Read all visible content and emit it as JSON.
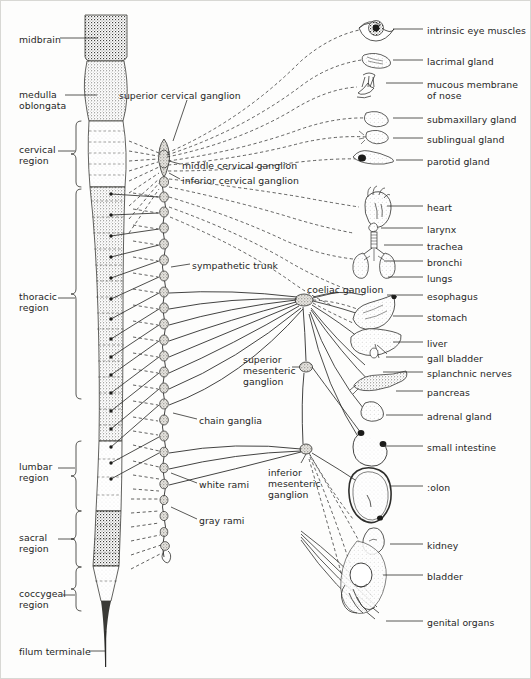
{
  "figure": {
    "background_color": "#fdfdfc",
    "ink_color": "#262626"
  },
  "left_labels": [
    {
      "id": "midbrain",
      "text": "midbrain",
      "x": 18,
      "y": 33
    },
    {
      "id": "medulla-oblongata",
      "text": "medulla\noblongata",
      "x": 18,
      "y": 88
    },
    {
      "id": "cervical-region",
      "text": "cervical\nregion",
      "x": 18,
      "y": 143
    },
    {
      "id": "thoracic-region",
      "text": "thoracic\nregion",
      "x": 18,
      "y": 290
    },
    {
      "id": "lumbar-region",
      "text": "lumbar\nregion",
      "x": 18,
      "y": 460
    },
    {
      "id": "sacral-region",
      "text": "sacral\nregion",
      "x": 18,
      "y": 531
    },
    {
      "id": "coccygeal-region",
      "text": "coccygeal\nregion",
      "x": 18,
      "y": 587
    },
    {
      "id": "filum-terminale",
      "text": "filum terminale",
      "x": 18,
      "y": 645
    }
  ],
  "center_labels": [
    {
      "id": "superior-cervical-ganglion",
      "text": "superior cervical ganglion",
      "x": 118,
      "y": 89
    },
    {
      "id": "middle-cervical-ganglion",
      "text": "middle cervical ganglion",
      "x": 181,
      "y": 159
    },
    {
      "id": "inferior-cervical-ganglion",
      "text": "inferior cervical ganglion",
      "x": 181,
      "y": 174
    },
    {
      "id": "sympathetic-trunk",
      "text": "sympathetic trunk",
      "x": 191,
      "y": 259
    },
    {
      "id": "coeliac-ganglion",
      "text": "coeliac ganglion",
      "x": 306,
      "y": 283
    },
    {
      "id": "superior-mesenteric-ganglion",
      "text": "superior\nmesenteric\nganglion",
      "x": 242,
      "y": 353
    },
    {
      "id": "chain-ganglia",
      "text": "chain ganglia",
      "x": 198,
      "y": 414
    },
    {
      "id": "white-rami",
      "text": "white rami",
      "x": 198,
      "y": 478
    },
    {
      "id": "inferior-mesenteric-ganglion",
      "text": "inferior\nmesenteric\nganglion",
      "x": 267,
      "y": 466
    },
    {
      "id": "gray-rami",
      "text": "gray rami",
      "x": 198,
      "y": 514
    }
  ],
  "right_labels": [
    {
      "id": "intrinsic-eye-muscles",
      "text": "intrinsic eye muscles",
      "x": 426,
      "y": 24,
      "leader_from": 392,
      "leader_to": 422,
      "leader_y": 28
    },
    {
      "id": "lacrimal-gland",
      "text": "lacrimal gland",
      "x": 426,
      "y": 55,
      "leader_from": 392,
      "leader_to": 422,
      "leader_y": 59
    },
    {
      "id": "mucous-membrane-of-nose",
      "text": "mucous membrane\nof nose",
      "x": 426,
      "y": 78,
      "leader_from": 385,
      "leader_to": 422,
      "leader_y": 82
    },
    {
      "id": "submaxillary-gland",
      "text": "submaxillary gland",
      "x": 426,
      "y": 113,
      "leader_from": 392,
      "leader_to": 422,
      "leader_y": 117
    },
    {
      "id": "sublingual-gland",
      "text": "sublingual gland",
      "x": 426,
      "y": 133,
      "leader_from": 392,
      "leader_to": 422,
      "leader_y": 137
    },
    {
      "id": "parotid-gland",
      "text": "parotid gland",
      "x": 426,
      "y": 155,
      "leader_from": 395,
      "leader_to": 422,
      "leader_y": 159
    },
    {
      "id": "heart",
      "text": "heart",
      "x": 426,
      "y": 201,
      "leader_from": 386,
      "leader_to": 422,
      "leader_y": 205
    },
    {
      "id": "larynx",
      "text": "larynx",
      "x": 426,
      "y": 223,
      "leader_from": 380,
      "leader_to": 422,
      "leader_y": 227
    },
    {
      "id": "trachea",
      "text": "trachea",
      "x": 426,
      "y": 240,
      "leader_from": 383,
      "leader_to": 422,
      "leader_y": 244
    },
    {
      "id": "bronchi",
      "text": "bronchi",
      "x": 426,
      "y": 256,
      "leader_from": 383,
      "leader_to": 422,
      "leader_y": 260
    },
    {
      "id": "lungs",
      "text": "lungs",
      "x": 426,
      "y": 272,
      "leader_from": 387,
      "leader_to": 422,
      "leader_y": 276
    },
    {
      "id": "esophagus",
      "text": "esophagus",
      "x": 426,
      "y": 290,
      "leader_from": 386,
      "leader_to": 422,
      "leader_y": 294
    },
    {
      "id": "stomach",
      "text": "stomach",
      "x": 426,
      "y": 311,
      "leader_from": 392,
      "leader_to": 422,
      "leader_y": 315
    },
    {
      "id": "liver",
      "text": "liver",
      "x": 426,
      "y": 337,
      "leader_from": 392,
      "leader_to": 422,
      "leader_y": 341
    },
    {
      "id": "gall-bladder",
      "text": "gall bladder",
      "x": 426,
      "y": 352,
      "leader_from": 385,
      "leader_to": 422,
      "leader_y": 356
    },
    {
      "id": "splanchnic-nerves",
      "text": "splanchnic nerves",
      "x": 426,
      "y": 367,
      "leader_from": 382,
      "leader_to": 422,
      "leader_y": 371
    },
    {
      "id": "pancreas",
      "text": "pancreas",
      "x": 426,
      "y": 386,
      "leader_from": 395,
      "leader_to": 422,
      "leader_y": 390
    },
    {
      "id": "adrenal-gland",
      "text": "adrenal gland",
      "x": 426,
      "y": 410,
      "leader_from": 385,
      "leader_to": 422,
      "leader_y": 414
    },
    {
      "id": "small-intestine",
      "text": "small intestine",
      "x": 426,
      "y": 441,
      "leader_from": 380,
      "leader_to": 422,
      "leader_y": 445
    },
    {
      "id": "colon",
      "text": ":olon",
      "x": 426,
      "y": 481,
      "leader_from": 390,
      "leader_to": 422,
      "leader_y": 485
    },
    {
      "id": "kidney",
      "text": "kidney",
      "x": 426,
      "y": 539,
      "leader_from": 389,
      "leader_to": 422,
      "leader_y": 543
    },
    {
      "id": "bladder",
      "text": "bladder",
      "x": 426,
      "y": 570,
      "leader_from": 382,
      "leader_to": 422,
      "leader_y": 574
    },
    {
      "id": "genital-organs",
      "text": "genital organs",
      "x": 426,
      "y": 616,
      "leader_from": 385,
      "leader_to": 422,
      "leader_y": 620
    }
  ],
  "spinal_cord": {
    "segments": [
      {
        "name": "midbrain",
        "y0": 14,
        "y1": 58,
        "shade": "#c9c6c0"
      },
      {
        "name": "medulla-oblongata",
        "y0": 58,
        "y1": 118,
        "shade": "#ddd9d3"
      },
      {
        "name": "cervical",
        "y0": 118,
        "y1": 186,
        "shade": "#f2f0ec"
      },
      {
        "name": "thoracic",
        "y0": 186,
        "y1": 440,
        "shade": "#d9d5cd"
      },
      {
        "name": "lumbar",
        "y0": 440,
        "y1": 510,
        "shade": "#eceae4"
      },
      {
        "name": "sacral",
        "y0": 510,
        "y1": 565,
        "shade": "#9a9890"
      },
      {
        "name": "coccygeal",
        "y0": 565,
        "y1": 600,
        "shade": "#e8e5df"
      },
      {
        "name": "filum-terminale",
        "y0": 600,
        "y1": 665,
        "shade": "#555"
      }
    ],
    "cord_center_x": 104
  },
  "sympathetic_chain": {
    "x": 163,
    "top_y": 140,
    "bottom_y": 553,
    "ganglion_count": 24
  },
  "prevertebral_ganglia": [
    {
      "name": "coeliac-ganglion",
      "x": 303,
      "y": 299,
      "r": 8
    },
    {
      "name": "superior-mesenteric-ganglion",
      "x": 305,
      "y": 366,
      "r": 6
    },
    {
      "name": "inferior-mesenteric-ganglion",
      "x": 305,
      "y": 448,
      "r": 6
    }
  ],
  "organs": [
    {
      "name": "eye",
      "x": 373,
      "y": 26
    },
    {
      "name": "lacrimal-gland",
      "x": 378,
      "y": 58
    },
    {
      "name": "nose",
      "x": 370,
      "y": 86
    },
    {
      "name": "submaxillary-gland",
      "x": 380,
      "y": 117
    },
    {
      "name": "sublingual-gland",
      "x": 378,
      "y": 136
    },
    {
      "name": "parotid-gland",
      "x": 372,
      "y": 159
    },
    {
      "name": "heart",
      "x": 375,
      "y": 207
    },
    {
      "name": "larynx",
      "x": 372,
      "y": 232
    },
    {
      "name": "bronchi-lungs",
      "x": 374,
      "y": 262
    },
    {
      "name": "stomach",
      "x": 378,
      "y": 312
    },
    {
      "name": "liver",
      "x": 374,
      "y": 342
    },
    {
      "name": "pancreas",
      "x": 380,
      "y": 380
    },
    {
      "name": "adrenal-gland",
      "x": 374,
      "y": 410
    },
    {
      "name": "small-intestine",
      "x": 374,
      "y": 444
    },
    {
      "name": "colon",
      "x": 378,
      "y": 487
    },
    {
      "name": "kidney",
      "x": 376,
      "y": 540
    },
    {
      "name": "bladder",
      "x": 372,
      "y": 578
    },
    {
      "name": "genital-organs",
      "x": 372,
      "y": 608
    }
  ]
}
